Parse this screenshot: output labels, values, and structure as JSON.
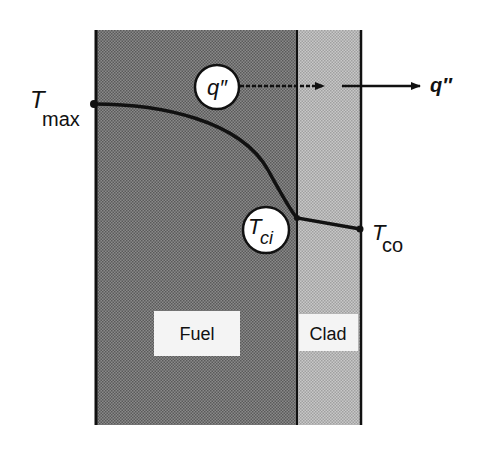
{
  "diagram": {
    "regions": [
      {
        "id": "fuel",
        "label": "Fuel",
        "fill": "#7a7a7a"
      },
      {
        "id": "clad",
        "label": "Clad",
        "fill": "#b8b8b8"
      }
    ],
    "labels": {
      "t_max_main": "T",
      "t_max_sub": "max",
      "t_ci_main": "T",
      "t_ci_sub": "ci",
      "t_co_main": "T",
      "t_co_sub": "co",
      "q_circle": "q″",
      "q_out": "q″"
    },
    "colors": {
      "line": "#111111",
      "background": "#ffffff",
      "label_box": "#f4f4f4"
    }
  }
}
